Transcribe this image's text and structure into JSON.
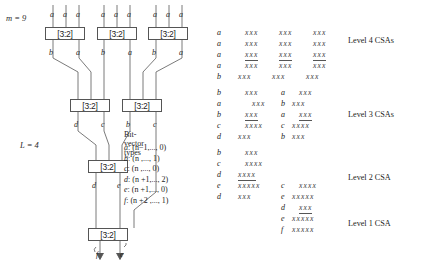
{
  "figure": {
    "params": {
      "m_label": "m = 9",
      "l_label": "L = 4"
    },
    "csa_boxes": [
      {
        "id": "csa-l4-1",
        "label": "[3:2]",
        "x": 45,
        "y": 27,
        "w": 40,
        "h": 13
      },
      {
        "id": "csa-l4-2",
        "label": "[3:2]",
        "x": 97,
        "y": 27,
        "w": 40,
        "h": 13
      },
      {
        "id": "csa-l4-3",
        "label": "[3:2]",
        "x": 148,
        "y": 27,
        "w": 40,
        "h": 13
      },
      {
        "id": "csa-l3-1",
        "label": "[3:2]",
        "x": 70,
        "y": 99,
        "w": 40,
        "h": 13
      },
      {
        "id": "csa-l3-2",
        "label": "[3:2]",
        "x": 122,
        "y": 99,
        "w": 40,
        "h": 13
      },
      {
        "id": "csa-l2-1",
        "label": "[3:2]",
        "x": 88,
        "y": 160,
        "w": 40,
        "h": 13
      },
      {
        "id": "csa-l1-1",
        "label": "[3:2]",
        "x": 88,
        "y": 228,
        "w": 40,
        "h": 13
      }
    ],
    "input_labels": [
      {
        "text": "a",
        "x": 50,
        "y": 10
      },
      {
        "text": "a",
        "x": 63,
        "y": 10
      },
      {
        "text": "a",
        "x": 76,
        "y": 10
      },
      {
        "text": "a",
        "x": 101,
        "y": 10
      },
      {
        "text": "a",
        "x": 114,
        "y": 10
      },
      {
        "text": "a",
        "x": 127,
        "y": 10
      },
      {
        "text": "a",
        "x": 153,
        "y": 10
      },
      {
        "text": "a",
        "x": 166,
        "y": 10
      },
      {
        "text": "a",
        "x": 179,
        "y": 10
      }
    ],
    "wire_labels": [
      {
        "text": "b",
        "x": 49,
        "y": 48
      },
      {
        "text": "a",
        "x": 76,
        "y": 48
      },
      {
        "text": "b",
        "x": 101,
        "y": 48
      },
      {
        "text": "a",
        "x": 128,
        "y": 48
      },
      {
        "text": "b",
        "x": 152,
        "y": 48
      },
      {
        "text": "a",
        "x": 179,
        "y": 48
      },
      {
        "text": "d",
        "x": 74,
        "y": 120
      },
      {
        "text": "c",
        "x": 101,
        "y": 120
      },
      {
        "text": "b",
        "x": 126,
        "y": 120
      },
      {
        "text": "c",
        "x": 153,
        "y": 120
      },
      {
        "text": "d",
        "x": 92,
        "y": 181
      },
      {
        "text": "e",
        "x": 117,
        "y": 181
      },
      {
        "text": "f",
        "x": 96,
        "y": 250
      },
      {
        "text": "e",
        "x": 120,
        "y": 250
      }
    ],
    "bit_vector_types": {
      "title": "Bit-vector types",
      "rows": [
        {
          "name": "a",
          "range": ": (n−1,..., 0)"
        },
        {
          "name": "b",
          "range": ": (n ,..., 1)"
        },
        {
          "name": "c",
          "range": ": (n ,..., 0)"
        },
        {
          "name": "d",
          "range": ": (n +1,..., 2)"
        },
        {
          "name": "e",
          "range": ": (n +1,..., 0)"
        },
        {
          "name": "f",
          "range": ": (n +2 ,..., 1)"
        }
      ]
    }
  },
  "dot_diagram": {
    "level_labels": [
      {
        "text": "Level 4 CSAs",
        "x": 135,
        "y": 36
      },
      {
        "text": "Level 3 CSAs",
        "x": 135,
        "y": 110
      },
      {
        "text": "Level 2 CSA",
        "x": 135,
        "y": 173
      },
      {
        "text": "Level 1 CSA",
        "x": 135,
        "y": 219
      }
    ],
    "rows": [
      {
        "y": 28,
        "cells": [
          {
            "tag": "a",
            "tx": 4
          },
          {
            "dots": "xxx",
            "x": 32,
            "ul": false
          },
          {
            "dots": "xxx",
            "x": 66,
            "ul": false
          },
          {
            "dots": "xxx",
            "x": 100,
            "ul": false
          }
        ]
      },
      {
        "y": 39,
        "cells": [
          {
            "tag": "a",
            "tx": 4
          },
          {
            "dots": "xxx",
            "x": 32,
            "ul": false
          },
          {
            "dots": "xxx",
            "x": 66,
            "ul": false
          },
          {
            "dots": "xxx",
            "x": 100,
            "ul": false
          }
        ]
      },
      {
        "y": 50,
        "cells": [
          {
            "tag": "a",
            "tx": 4
          },
          {
            "dots": "xxx",
            "x": 32,
            "ul": true
          },
          {
            "dots": "xxx",
            "x": 66,
            "ul": true
          },
          {
            "dots": "xxx",
            "x": 100,
            "ul": true
          }
        ]
      },
      {
        "y": 61,
        "cells": [
          {
            "tag": "a",
            "tx": 4
          },
          {
            "dots": "xxx",
            "x": 32,
            "ul": false
          },
          {
            "dots": "xxx",
            "x": 66,
            "ul": false
          },
          {
            "dots": "xxx",
            "x": 100,
            "ul": false
          }
        ]
      },
      {
        "y": 72,
        "cells": [
          {
            "tag": "b",
            "tx": 4
          },
          {
            "dots": "xxx",
            "x": 25,
            "ul": false
          },
          {
            "dots": "xxx",
            "x": 59,
            "ul": false
          },
          {
            "dots": "xxx",
            "x": 93,
            "ul": false
          }
        ]
      },
      {
        "y": 88,
        "cells": [
          {
            "tag": "b",
            "tx": 4
          },
          {
            "dots": "xxx",
            "x": 32,
            "ul": false
          },
          {
            "tag": "a",
            "tx": 68
          },
          {
            "dots": "xxx",
            "x": 86,
            "ul": false
          }
        ]
      },
      {
        "y": 99,
        "cells": [
          {
            "tag": "a",
            "tx": 4
          },
          {
            "dots": "xxx",
            "x": 39,
            "ul": false
          },
          {
            "tag": "b",
            "tx": 68
          },
          {
            "dots": "xxx",
            "x": 79,
            "ul": false
          }
        ]
      },
      {
        "y": 110,
        "cells": [
          {
            "tag": "b",
            "tx": 4
          },
          {
            "dots": "xxx",
            "x": 32,
            "ul": true
          },
          {
            "tag": "a",
            "tx": 68
          },
          {
            "dots": "xxx",
            "x": 86,
            "ul": true
          }
        ]
      },
      {
        "y": 121,
        "cells": [
          {
            "tag": "c",
            "tx": 4
          },
          {
            "dots": "xxxx",
            "x": 32,
            "ul": false
          },
          {
            "tag": "c",
            "tx": 68
          },
          {
            "dots": "xxxx",
            "x": 79,
            "ul": false
          }
        ]
      },
      {
        "y": 132,
        "cells": [
          {
            "tag": "d",
            "tx": 4
          },
          {
            "dots": "xxx",
            "x": 25,
            "ul": false
          },
          {
            "tag": "b",
            "tx": 68
          },
          {
            "dots": "xxx",
            "x": 79,
            "ul": false
          }
        ]
      },
      {
        "y": 148,
        "cells": [
          {
            "tag": "b",
            "tx": 4
          },
          {
            "dots": "xxx",
            "x": 32,
            "ul": false
          }
        ]
      },
      {
        "y": 159,
        "cells": [
          {
            "tag": "c",
            "tx": 4
          },
          {
            "dots": "xxxx",
            "x": 32,
            "ul": false
          }
        ]
      },
      {
        "y": 170,
        "cells": [
          {
            "tag": "d",
            "tx": 4
          },
          {
            "dots": "xxxx",
            "x": 25,
            "ul": true
          }
        ]
      },
      {
        "y": 181,
        "cells": [
          {
            "tag": "e",
            "tx": 4
          },
          {
            "dots": "xxxxx",
            "x": 25,
            "ul": false
          },
          {
            "tag": "c",
            "tx": 68
          },
          {
            "dots": "xxxx",
            "x": 86,
            "ul": false
          }
        ]
      },
      {
        "y": 192,
        "cells": [
          {
            "tag": "d",
            "tx": 4
          },
          {
            "dots": "xxx",
            "x": 25,
            "ul": false
          },
          {
            "tag": "e",
            "tx": 68
          },
          {
            "dots": "xxxxx",
            "x": 79,
            "ul": false
          }
        ]
      },
      {
        "y": 203,
        "cells": [
          {
            "tag": "d",
            "tx": 68
          },
          {
            "dots": "xxx",
            "x": 86,
            "ul": true
          }
        ]
      },
      {
        "y": 214,
        "cells": [
          {
            "tag": "e",
            "tx": 68
          },
          {
            "dots": "xxxxx",
            "x": 79,
            "ul": false
          }
        ]
      },
      {
        "y": 225,
        "cells": [
          {
            "tag": "f",
            "tx": 68
          },
          {
            "dots": "xxxxx",
            "x": 79,
            "ul": false
          }
        ]
      }
    ]
  }
}
